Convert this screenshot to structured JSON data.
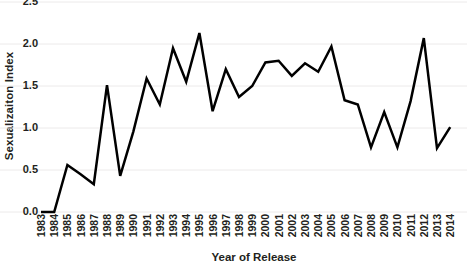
{
  "chart_data": {
    "type": "line",
    "title": "",
    "xlabel": "Year of Release",
    "ylabel": "Sexualizaiton Index",
    "x": [
      1983,
      1984,
      1985,
      1986,
      1987,
      1988,
      1989,
      1990,
      1991,
      1992,
      1993,
      1994,
      1995,
      1996,
      1997,
      1998,
      1999,
      2000,
      2001,
      2002,
      2003,
      2004,
      2005,
      2006,
      2007,
      2008,
      2009,
      2010,
      2011,
      2012,
      2013,
      2014
    ],
    "categories": [
      "1983",
      "1984",
      "1985",
      "1986",
      "1987",
      "1988",
      "1989",
      "1990",
      "1991",
      "1992",
      "1993",
      "1994",
      "1995",
      "1996",
      "1997",
      "1998",
      "1999",
      "2000",
      "2001",
      "2002",
      "2003",
      "2004",
      "2005",
      "2006",
      "2007",
      "2008",
      "2009",
      "2010",
      "2011",
      "2012",
      "2013",
      "2014"
    ],
    "values": [
      0.0,
      0.0,
      0.56,
      0.45,
      0.33,
      1.51,
      0.43,
      0.96,
      1.59,
      1.28,
      1.95,
      1.55,
      2.13,
      1.2,
      1.7,
      1.37,
      1.5,
      1.78,
      1.8,
      1.62,
      1.77,
      1.67,
      1.97,
      1.33,
      1.28,
      0.77,
      1.19,
      0.77,
      1.32,
      2.07,
      0.76,
      1.01
    ],
    "series": [
      {
        "name": "Sexualizaiton Index",
        "values": [
          0.0,
          0.0,
          0.56,
          0.45,
          0.33,
          1.51,
          0.43,
          0.96,
          1.59,
          1.28,
          1.95,
          1.55,
          2.13,
          1.2,
          1.7,
          1.37,
          1.5,
          1.78,
          1.8,
          1.62,
          1.77,
          1.67,
          1.97,
          1.33,
          1.28,
          0.77,
          1.19,
          0.77,
          1.32,
          2.07,
          0.76,
          1.01
        ],
        "color": "#000000"
      }
    ],
    "ylim": [
      0.0,
      2.5
    ],
    "yticks": [
      "2.5",
      "2.0",
      "1.5",
      "1.0",
      "0.5",
      "0.0"
    ],
    "ytick_values": [
      2.5,
      2.0,
      1.5,
      1.0,
      0.5,
      0.0
    ],
    "xlim": [
      1983,
      2014
    ],
    "grid": "horizontal",
    "grid_color": "#eceaea",
    "legend": "none",
    "line_color": "#000000",
    "line_width": 2.5,
    "background": "#ffffff"
  }
}
